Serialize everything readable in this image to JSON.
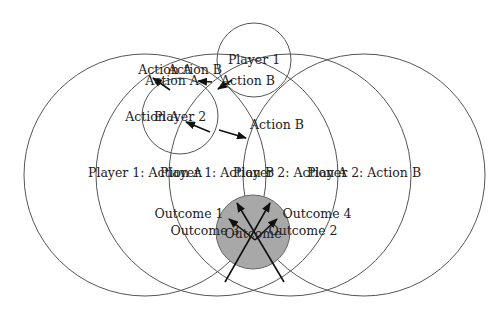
{
  "diagram": {
    "colors": {
      "stroke": "#555555",
      "outcome_fill": "#a8a8a8",
      "arrow": "#111111",
      "text": "#222222"
    },
    "big_circles": [
      {
        "id": "p1-action-a",
        "cx": 145,
        "cy": 175,
        "r": 121,
        "label": "Player 1: Action A",
        "label_x": 145,
        "label_y": 177
      },
      {
        "id": "p1-action-b",
        "cx": 217,
        "cy": 175,
        "r": 121,
        "label": "Player 1: Action B",
        "label_x": 217,
        "label_y": 177
      },
      {
        "id": "p2-action-a",
        "cx": 290,
        "cy": 175,
        "r": 121,
        "label": "Player 2: Action A",
        "label_x": 290,
        "label_y": 177
      },
      {
        "id": "p2-action-b",
        "cx": 364,
        "cy": 175,
        "r": 121,
        "label": "Player 2: Action B",
        "label_x": 364,
        "label_y": 177
      }
    ],
    "player_circles": [
      {
        "id": "player-1",
        "cx": 254,
        "cy": 60,
        "r": 37,
        "label": "Player 1",
        "label_x": 254,
        "label_y": 64
      },
      {
        "id": "player-2",
        "cx": 180,
        "cy": 116,
        "r": 38,
        "label": "Player 2",
        "label_x": 180,
        "label_y": 121
      }
    ],
    "outcome": {
      "cx": 253,
      "cy": 232,
      "r": 37,
      "label": "Outcome",
      "label_x": 253,
      "label_y": 238
    },
    "labels": [
      {
        "id": "action-a-top-1",
        "text": "Action A",
        "x": 165,
        "y": 74
      },
      {
        "id": "action-b-top",
        "text": "Action B",
        "x": 195,
        "y": 74
      },
      {
        "id": "action-a-top-2",
        "text": "Action A",
        "x": 172,
        "y": 85
      },
      {
        "id": "action-b-p1",
        "text": "Action B",
        "x": 248,
        "y": 85
      },
      {
        "id": "action-a-p2",
        "text": "Action A",
        "x": 152,
        "y": 121
      },
      {
        "id": "action-b-p2",
        "text": "Action B",
        "x": 277,
        "y": 129
      },
      {
        "id": "outcome-1",
        "text": "Outcome 1",
        "x": 189,
        "y": 218
      },
      {
        "id": "outcome-4",
        "text": "Outcome 4",
        "x": 317,
        "y": 218
      },
      {
        "id": "outcome-3",
        "text": "Outcome 3",
        "x": 205,
        "y": 235
      },
      {
        "id": "outcome-2",
        "text": "Outcome 2",
        "x": 303,
        "y": 235
      }
    ],
    "arrows": [
      {
        "id": "arrow-action-a-1",
        "x1": 170,
        "y1": 90,
        "x2": 153,
        "y2": 78
      },
      {
        "id": "arrow-action-a-2",
        "x1": 212,
        "y1": 82,
        "x2": 198,
        "y2": 81
      },
      {
        "id": "arrow-action-b-p1",
        "x1": 232,
        "y1": 80,
        "x2": 218,
        "y2": 89
      },
      {
        "id": "arrow-p2-action-a",
        "x1": 210,
        "y1": 132,
        "x2": 186,
        "y2": 122
      },
      {
        "id": "arrow-p2-action-b",
        "x1": 219,
        "y1": 130,
        "x2": 246,
        "y2": 138
      },
      {
        "id": "arrow-outcome-1",
        "x1": 255,
        "y1": 240,
        "x2": 229,
        "y2": 219
      },
      {
        "id": "arrow-outcome-2",
        "x1": 255,
        "y1": 240,
        "x2": 277,
        "y2": 219
      },
      {
        "id": "arrow-outcome-3",
        "x1": 225,
        "y1": 282,
        "x2": 270,
        "y2": 203
      },
      {
        "id": "arrow-outcome-4",
        "x1": 284,
        "y1": 282,
        "x2": 237,
        "y2": 203
      }
    ]
  }
}
